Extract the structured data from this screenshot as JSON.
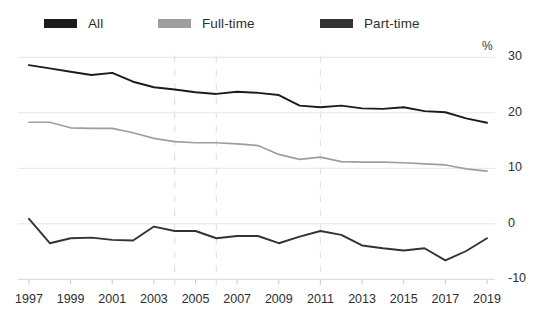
{
  "legend": {
    "position": "top-left",
    "items": [
      {
        "label": "All",
        "color": "#1c1c1c"
      },
      {
        "label": "Full-time",
        "color": "#9e9e9e"
      },
      {
        "label": "Part-time",
        "color": "#333333"
      }
    ]
  },
  "axes": {
    "y_unit": "%",
    "y_ticks": [
      "30",
      "20",
      "10",
      "0",
      "-10"
    ],
    "x_ticks": [
      "1997",
      "1999",
      "2001",
      "2003",
      "2005",
      "2007",
      "2009",
      "2011",
      "2013",
      "2015",
      "2017",
      "2019"
    ]
  },
  "chart_data": {
    "type": "line",
    "title": "",
    "subtitle": "",
    "xlabel": "",
    "ylabel": "%",
    "ylim": [
      -10,
      30
    ],
    "xlim": [
      1997,
      2019
    ],
    "grid": "horizontal-gridlines-plus-dashed-verticals",
    "legend_position": "top",
    "dashed_vertical_years": [
      2004,
      2006,
      2011
    ],
    "x": [
      1997,
      1998,
      1999,
      2000,
      2001,
      2002,
      2003,
      2004,
      2005,
      2006,
      2007,
      2008,
      2009,
      2010,
      2011,
      2012,
      2013,
      2014,
      2015,
      2016,
      2017,
      2018,
      2019
    ],
    "series": [
      {
        "name": "All",
        "color": "#1c1c1c",
        "values": [
          28.6,
          28.0,
          27.4,
          26.8,
          27.2,
          25.6,
          24.6,
          24.2,
          23.7,
          23.4,
          23.8,
          23.6,
          23.2,
          21.3,
          21.0,
          21.3,
          20.8,
          20.7,
          21.0,
          20.3,
          20.1,
          19.0,
          18.2
        ]
      },
      {
        "name": "Full-time",
        "color": "#9e9e9e",
        "values": [
          18.3,
          18.3,
          17.3,
          17.2,
          17.2,
          16.4,
          15.4,
          14.8,
          14.6,
          14.6,
          14.4,
          14.1,
          12.5,
          11.6,
          12.0,
          11.2,
          11.1,
          11.1,
          11.0,
          10.8,
          10.6,
          9.9,
          9.5
        ]
      },
      {
        "name": "Part-time",
        "color": "#333333",
        "values": [
          0.9,
          -3.5,
          -2.6,
          -2.5,
          -2.9,
          -3.0,
          -0.5,
          -1.3,
          -1.3,
          -2.6,
          -2.2,
          -2.2,
          -3.5,
          -2.3,
          -1.3,
          -2.0,
          -3.9,
          -4.4,
          -4.8,
          -4.4,
          -6.6,
          -4.9,
          -2.6
        ]
      }
    ]
  },
  "cutoff_title": ""
}
